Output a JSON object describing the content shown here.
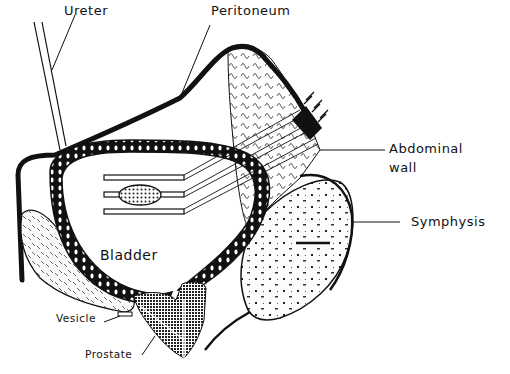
{
  "diagram": {
    "type": "anatomical cross-section",
    "colors": {
      "ink": "#111111",
      "background": "#ffffff"
    },
    "labels": {
      "ureter": "Ureter",
      "peritoneum": "Peritoneum",
      "abdominal_wall_line1": "Abdominal",
      "abdominal_wall_line2": "wall",
      "symphysis": "Symphysis",
      "bladder": "Bladder",
      "vesicle": "Vesicle",
      "prostate": "Prostate"
    }
  }
}
